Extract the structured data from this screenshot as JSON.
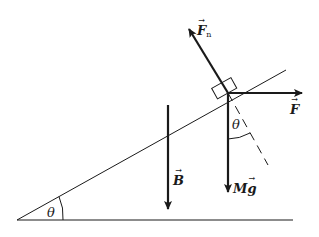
{
  "diagram": {
    "type": "free-body diagram on inclined plane",
    "colors": {
      "stroke": "#1a1a1a",
      "background": "#ffffff"
    },
    "labels": {
      "normal_force": "F",
      "normal_force_sub": "n",
      "applied_force": "F",
      "buoyant_or_field": "B",
      "weight_M": "M",
      "weight_g": "g",
      "incline_angle": "θ",
      "weight_angle": "θ"
    },
    "vectors": [
      {
        "name": "Fn",
        "from": [
          228,
          93
        ],
        "to": [
          188,
          27
        ]
      },
      {
        "name": "F",
        "from": [
          228,
          93
        ],
        "to": [
          303,
          93
        ]
      },
      {
        "name": "Mg",
        "from": [
          228,
          93
        ],
        "to": [
          228,
          193
        ]
      },
      {
        "name": "B",
        "from": [
          168,
          105
        ],
        "to": [
          168,
          210
        ]
      }
    ],
    "incline": {
      "from": [
        17,
        220
      ],
      "to": [
        286,
        70
      ]
    },
    "ground": {
      "from": [
        17,
        220
      ],
      "to": [
        293,
        220
      ]
    }
  }
}
